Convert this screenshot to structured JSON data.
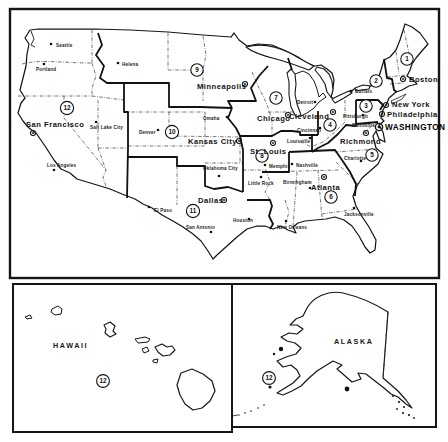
{
  "colors": {
    "ink": "#161616",
    "paper": "#ffffff"
  },
  "federal_reserve_map": {
    "capital": "WASHINGTON",
    "bank_cities": [
      "Boston",
      "New York",
      "Philadelphia",
      "Cleveland",
      "Richmond",
      "Atlanta",
      "Chicago",
      "St. Louis",
      "Minneapolis",
      "Kansas City",
      "Dallas",
      "San Francisco"
    ],
    "branch_cities": [
      "Seattle",
      "Portland",
      "Helena",
      "Salt Lake City",
      "Los Angeles",
      "Denver",
      "Omaha",
      "Oklahoma City",
      "El Paso",
      "San Antonio",
      "Houston",
      "New Orleans",
      "Jacksonville",
      "Birmingham",
      "Memphis",
      "Nashville",
      "Little Rock",
      "Louisville",
      "Cincinnati",
      "Pittsburgh",
      "Baltimore",
      "Buffalo",
      "Detroit",
      "Charlotte"
    ],
    "district_numbers": [
      "1",
      "2",
      "3",
      "4",
      "5",
      "6",
      "7",
      "8",
      "9",
      "10",
      "11",
      "12"
    ],
    "insets": {
      "hawaii": {
        "label": "HAWAII",
        "district_number": "12"
      },
      "alaska": {
        "label": "ALASKA",
        "district_number": "12"
      }
    }
  }
}
